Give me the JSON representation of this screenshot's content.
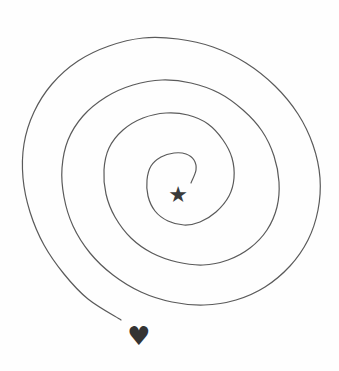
{
  "puzzle": {
    "type": "spiral-maze",
    "start_marker": {
      "icon": "star-icon",
      "glyph": "★",
      "cx": 178,
      "cy": 194,
      "size": 22,
      "color": "#3a3a3a"
    },
    "end_marker": {
      "icon": "heart-icon",
      "glyph": "♥",
      "cx": 139,
      "cy": 336,
      "size": 26,
      "color": "#333333"
    },
    "spiral": {
      "stroke": "#5a5a5a",
      "stroke_width": 1.2,
      "points": [
        [
          191,
          183
        ],
        [
          196,
          170
        ],
        [
          194,
          160
        ],
        [
          186,
          154
        ],
        [
          174,
          153
        ],
        [
          161,
          157
        ],
        [
          151,
          166
        ],
        [
          147,
          180
        ],
        [
          148,
          196
        ],
        [
          155,
          211
        ],
        [
          168,
          221
        ],
        [
          184,
          225
        ],
        [
          200,
          222
        ],
        [
          216,
          212
        ],
        [
          229,
          196
        ],
        [
          234,
          178
        ],
        [
          232,
          158
        ],
        [
          223,
          140
        ],
        [
          208,
          124
        ],
        [
          188,
          115
        ],
        [
          166,
          113
        ],
        [
          143,
          118
        ],
        [
          123,
          130
        ],
        [
          109,
          148
        ],
        [
          104,
          170
        ],
        [
          106,
          194
        ],
        [
          115,
          217
        ],
        [
          131,
          238
        ],
        [
          152,
          253
        ],
        [
          177,
          262
        ],
        [
          203,
          265
        ],
        [
          228,
          260
        ],
        [
          250,
          248
        ],
        [
          267,
          230
        ],
        [
          277,
          207
        ],
        [
          279,
          182
        ],
        [
          274,
          156
        ],
        [
          262,
          131
        ],
        [
          243,
          110
        ],
        [
          219,
          93
        ],
        [
          191,
          83
        ],
        [
          162,
          80
        ],
        [
          133,
          85
        ],
        [
          106,
          97
        ],
        [
          83,
          116
        ],
        [
          68,
          140
        ],
        [
          62,
          168
        ],
        [
          64,
          197
        ],
        [
          73,
          226
        ],
        [
          90,
          253
        ],
        [
          113,
          275
        ],
        [
          141,
          292
        ],
        [
          172,
          302
        ],
        [
          204,
          305
        ],
        [
          236,
          300
        ],
        [
          265,
          287
        ],
        [
          290,
          266
        ],
        [
          308,
          240
        ],
        [
          318,
          210
        ],
        [
          320,
          178
        ],
        [
          313,
          145
        ],
        [
          298,
          114
        ],
        [
          275,
          86
        ],
        [
          246,
          63
        ],
        [
          213,
          47
        ],
        [
          178,
          39
        ],
        [
          143,
          38
        ],
        [
          109,
          46
        ],
        [
          78,
          61
        ],
        [
          52,
          84
        ],
        [
          34,
          112
        ],
        [
          24,
          144
        ],
        [
          23,
          178
        ],
        [
          30,
          212
        ],
        [
          44,
          245
        ],
        [
          64,
          274
        ],
        [
          88,
          299
        ],
        [
          121,
          320
        ]
      ]
    }
  }
}
